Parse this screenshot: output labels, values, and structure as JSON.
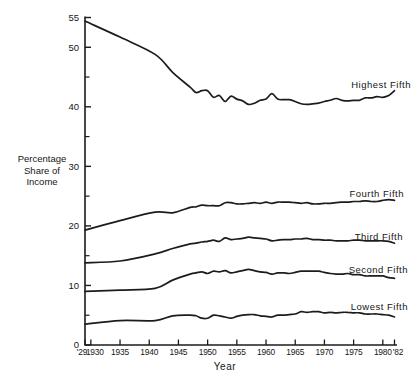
{
  "figure": {
    "background": "#ffffff",
    "line_color": "#1c1c1c",
    "text_color": "#161616"
  },
  "chart_data": {
    "type": "line",
    "title": "",
    "xlabel": "Year",
    "ylabel": "Percentage Share of Income",
    "ylabel_lines": [
      "Percentage",
      "Share of",
      "Income"
    ],
    "xlim": [
      1929,
      1982
    ],
    "ylim": [
      0,
      55
    ],
    "grid": false,
    "legend_position": "labels-right-of-lines",
    "y_major_ticks": [
      0,
      10,
      20,
      30,
      40,
      50,
      55
    ],
    "y_minor_ticks": [
      5,
      15,
      25,
      35,
      45
    ],
    "x_ticks": [
      {
        "value": 1929,
        "label": "'29"
      },
      {
        "value": 1930,
        "label": "1930"
      },
      {
        "value": 1935,
        "label": "1935"
      },
      {
        "value": 1940,
        "label": "1940"
      },
      {
        "value": 1945,
        "label": "1945"
      },
      {
        "value": 1950,
        "label": "1950"
      },
      {
        "value": 1955,
        "label": "1955"
      },
      {
        "value": 1960,
        "label": "1960"
      },
      {
        "value": 1965,
        "label": "1965"
      },
      {
        "value": 1970,
        "label": "1970"
      },
      {
        "value": 1975,
        "label": "1975"
      },
      {
        "value": 1980,
        "label": "1980"
      },
      {
        "value": 1982,
        "label": "'82"
      }
    ],
    "x": [
      1929,
      1935,
      1941,
      1944,
      1947,
      1948,
      1949,
      1950,
      1951,
      1952,
      1953,
      1954,
      1955,
      1956,
      1957,
      1958,
      1959,
      1960,
      1961,
      1962,
      1963,
      1964,
      1965,
      1966,
      1967,
      1968,
      1969,
      1970,
      1971,
      1972,
      1973,
      1974,
      1975,
      1976,
      1977,
      1978,
      1979,
      1980,
      1981,
      1982
    ],
    "series": [
      {
        "name": "Highest Fifth",
        "values": [
          54.4,
          51.7,
          48.8,
          45.8,
          43.3,
          42.4,
          42.7,
          42.7,
          41.6,
          41.9,
          40.9,
          41.8,
          41.3,
          41.0,
          40.4,
          40.6,
          41.1,
          41.3,
          42.2,
          41.3,
          41.2,
          41.2,
          40.9,
          40.5,
          40.4,
          40.5,
          40.6,
          40.9,
          41.1,
          41.4,
          41.1,
          41.0,
          41.1,
          41.1,
          41.5,
          41.5,
          41.7,
          41.6,
          41.9,
          42.7
        ]
      },
      {
        "name": "Fourth Fifth",
        "values": [
          19.3,
          20.9,
          22.3,
          22.2,
          23.1,
          23.2,
          23.5,
          23.4,
          23.4,
          23.4,
          23.9,
          23.9,
          23.7,
          23.7,
          23.8,
          23.9,
          23.8,
          24.0,
          23.8,
          24.0,
          24.0,
          24.0,
          23.9,
          23.8,
          23.9,
          23.7,
          23.7,
          23.8,
          23.8,
          23.9,
          24.0,
          24.0,
          24.1,
          24.1,
          24.2,
          24.1,
          24.1,
          24.3,
          24.4,
          24.3
        ]
      },
      {
        "name": "Third Fifth",
        "values": [
          13.8,
          14.1,
          15.3,
          16.2,
          17.0,
          17.1,
          17.3,
          17.4,
          17.6,
          17.4,
          18.0,
          17.7,
          17.8,
          17.9,
          18.1,
          18.0,
          17.9,
          17.8,
          17.5,
          17.6,
          17.7,
          17.7,
          17.8,
          17.8,
          17.9,
          17.7,
          17.7,
          17.6,
          17.6,
          17.5,
          17.5,
          17.5,
          17.6,
          17.6,
          17.5,
          17.5,
          17.5,
          17.5,
          17.4,
          17.1
        ]
      },
      {
        "name": "Second Fifth",
        "values": [
          9.0,
          9.2,
          9.5,
          10.9,
          11.9,
          12.1,
          12.3,
          12.0,
          12.4,
          12.3,
          12.5,
          12.1,
          12.3,
          12.5,
          12.7,
          12.5,
          12.3,
          12.2,
          11.9,
          12.1,
          12.1,
          12.0,
          12.2,
          12.4,
          12.4,
          12.4,
          12.4,
          12.2,
          12.0,
          11.9,
          11.9,
          12.0,
          11.8,
          11.8,
          11.6,
          11.6,
          11.6,
          11.6,
          11.3,
          11.2
        ]
      },
      {
        "name": "Lowest Fifth",
        "values": [
          3.5,
          4.1,
          4.1,
          4.9,
          5.0,
          4.9,
          4.5,
          4.5,
          5.0,
          4.9,
          4.7,
          4.5,
          4.8,
          5.0,
          5.1,
          5.1,
          4.9,
          4.8,
          4.7,
          5.0,
          5.0,
          5.1,
          5.2,
          5.6,
          5.5,
          5.6,
          5.6,
          5.4,
          5.5,
          5.4,
          5.5,
          5.5,
          5.4,
          5.4,
          5.2,
          5.2,
          5.2,
          5.1,
          5.0,
          4.7
        ]
      }
    ]
  }
}
